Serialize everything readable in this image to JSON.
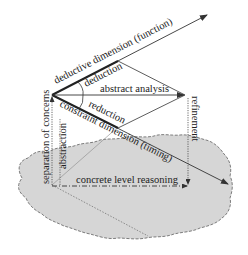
{
  "diagram": {
    "labels": {
      "deductive_dimension": "deductive dimension (function)",
      "deduction": "deduction",
      "abstract_analysis": "abstract analysis",
      "reduction": "reduction",
      "constraint_dimension": "constraint dimension (timing)",
      "separation_of_concerns": "separation of concerns",
      "abstraction": "abstraction",
      "refinement": "refinement",
      "concrete_level_reasoning": "concrete level reasoning"
    },
    "colors": {
      "cloud_fill": "#d6d6d6",
      "cloud_stroke": "#777777",
      "line": "#333333"
    }
  }
}
